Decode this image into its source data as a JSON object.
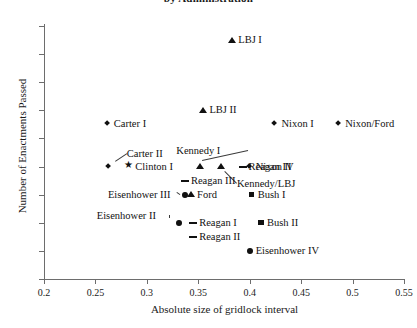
{
  "chart_data": {
    "type": "scatter",
    "title": "by Administration",
    "xlabel": "Absolute size of gridlock interval",
    "ylabel": "Number of Enactments Passed",
    "xlim": [
      0.2,
      0.55
    ],
    "ylim": [
      2,
      20
    ],
    "xticks": [
      "0.2",
      "0.25",
      "0.3",
      "0.35",
      "0.4",
      "0.45",
      "0.5",
      "0.55"
    ],
    "xtick_values": [
      0.2,
      0.25,
      0.3,
      0.35,
      0.4,
      0.45,
      0.5,
      0.55
    ],
    "yticks": [
      "2",
      "4",
      "6",
      "8",
      "10",
      "12",
      "14",
      "16",
      "18",
      "20"
    ],
    "ytick_values": [
      2,
      4,
      6,
      8,
      10,
      12,
      14,
      16,
      18,
      20
    ],
    "grid": false,
    "legend": "none",
    "points": [
      {
        "label": "LBJ I",
        "x": 0.383,
        "y": 19,
        "marker": "triangle",
        "label_pos": "right"
      },
      {
        "label": "LBJ II",
        "x": 0.355,
        "y": 14,
        "marker": "triangle",
        "label_pos": "right"
      },
      {
        "label": "Carter I",
        "x": 0.262,
        "y": 13,
        "marker": "diamond",
        "label_pos": "right"
      },
      {
        "label": "Nixon I",
        "x": 0.425,
        "y": 13,
        "marker": "diamond",
        "label_pos": "right"
      },
      {
        "label": "Nixon/Ford",
        "x": 0.487,
        "y": 13,
        "marker": "diamond",
        "label_pos": "right"
      },
      {
        "label": "Carter II",
        "x": 0.263,
        "y": 10,
        "marker": "diamond",
        "label_pos": "leader-up-right"
      },
      {
        "label": "Clinton I",
        "x": 0.283,
        "y": 10,
        "marker": "star",
        "label_pos": "right"
      },
      {
        "label": "Kennedy I",
        "x": 0.352,
        "y": 10,
        "marker": "triangle",
        "label_pos": "leader-up"
      },
      {
        "label": "Kennedy/LBJ",
        "x": 0.372,
        "y": 10,
        "marker": "triangle",
        "label_pos": "leader-down-right"
      },
      {
        "label": "Reagan IV",
        "x": 0.393,
        "y": 10,
        "marker": "dash",
        "label_pos": "right"
      },
      {
        "label": "Nixon II",
        "x": 0.4,
        "y": 10,
        "marker": "diamond",
        "label_pos": "right"
      },
      {
        "label": "Reagan III",
        "x": 0.337,
        "y": 9,
        "marker": "dash",
        "label_pos": "right"
      },
      {
        "label": "Eisenhower III",
        "x": 0.337,
        "y": 8,
        "marker": "circle",
        "label_pos": "leader-left"
      },
      {
        "label": "Ford",
        "x": 0.343,
        "y": 8,
        "marker": "triangle",
        "label_pos": "right"
      },
      {
        "label": "Bush I",
        "x": 0.402,
        "y": 8,
        "marker": "square",
        "label_pos": "right"
      },
      {
        "label": "Eisenhower II",
        "x": 0.331,
        "y": 6,
        "marker": "circle",
        "label_pos": "leader-left"
      },
      {
        "label": "Reagan I",
        "x": 0.345,
        "y": 6,
        "marker": "dash",
        "label_pos": "right"
      },
      {
        "label": "Bush II",
        "x": 0.411,
        "y": 6,
        "marker": "square",
        "label_pos": "right"
      },
      {
        "label": "Reagan II",
        "x": 0.345,
        "y": 5,
        "marker": "dash",
        "label_pos": "right"
      },
      {
        "label": "Eisenhower IV",
        "x": 0.4,
        "y": 4,
        "marker": "circle",
        "label_pos": "right"
      }
    ]
  },
  "colors": {
    "marker": "#111111",
    "axis": "#6d6d6d",
    "background": "#ffffff"
  }
}
